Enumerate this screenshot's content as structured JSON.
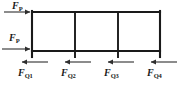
{
  "figure": {
    "type": "structural-frame-diagram",
    "colors": {
      "line": "#1a1a1a",
      "background": "#ffffff",
      "arrow": "#3a3a3a"
    },
    "frame": {
      "top_beam_y": 12,
      "bottom_beam_y": 51,
      "left_x": 32,
      "right_x": 160,
      "column_x": [
        32,
        75,
        118,
        160
      ],
      "column_foot_y": 57,
      "bays": 3,
      "line_width": 2
    },
    "applied_loads": [
      {
        "id": "load-top",
        "symbol": "F",
        "subscript": "P",
        "label": "F_P",
        "direction": "right",
        "y": 12,
        "arrow_x_start": 4,
        "arrow_x_end": 32
      },
      {
        "id": "load-mid",
        "symbol": "F",
        "subscript": "P",
        "label": "F_P",
        "direction": "right",
        "y": 49,
        "arrow_x_start": 2,
        "arrow_x_end": 32
      }
    ],
    "base_shears": [
      {
        "id": "shear-1",
        "symbol": "F",
        "subscript": "Q1",
        "label": "F_Q1",
        "direction": "left",
        "y": 62,
        "arrow_x_start": 48,
        "arrow_x_end": 20
      },
      {
        "id": "shear-2",
        "symbol": "F",
        "subscript": "Q2",
        "label": "F_Q2",
        "direction": "left",
        "y": 62,
        "arrow_x_start": 91,
        "arrow_x_end": 63
      },
      {
        "id": "shear-3",
        "symbol": "F",
        "subscript": "Q3",
        "label": "F_Q3",
        "direction": "left",
        "y": 62,
        "arrow_x_start": 134,
        "arrow_x_end": 106
      },
      {
        "id": "shear-4",
        "symbol": "F",
        "subscript": "Q4",
        "label": "F_Q4",
        "direction": "left",
        "y": 62,
        "arrow_x_start": 177,
        "arrow_x_end": 149
      }
    ]
  }
}
